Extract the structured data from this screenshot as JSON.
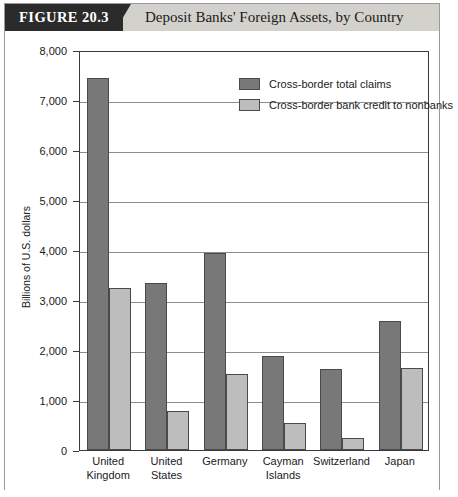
{
  "figure": {
    "tag": "FIGURE 20.3",
    "title": "Deposit Banks' Foreign Assets, by Country"
  },
  "legend": {
    "items": [
      {
        "label": "Cross-border total claims",
        "swatch": "#787878",
        "key": "legend-swatch-dark"
      },
      {
        "label": "Cross-border bank credit to nonbanks",
        "swatch": "#bdbdbd",
        "key": "legend-swatch-light"
      }
    ]
  },
  "axes": {
    "y_title": "Billions of U.S. dollars",
    "y_ticks": [
      "0",
      "1,000",
      "2,000",
      "3,000",
      "4,000",
      "5,000",
      "6,000",
      "7,000",
      "8,000"
    ]
  },
  "categories": [
    {
      "line1": "United",
      "line2": "Kingdom"
    },
    {
      "line1": "United",
      "line2": "States"
    },
    {
      "line1": "Germany",
      "line2": ""
    },
    {
      "line1": "Cayman",
      "line2": "Islands"
    },
    {
      "line1": "Switzerland",
      "line2": ""
    },
    {
      "line1": "Japan",
      "line2": ""
    }
  ],
  "chart_data": {
    "type": "bar",
    "title": "Deposit Banks' Foreign Assets, by Country",
    "xlabel": "",
    "ylabel": "Billions of U.S. dollars",
    "ylim": [
      0,
      8000
    ],
    "ytick_step": 1000,
    "grid": true,
    "legend_position": "top-right-inside",
    "categories": [
      "United Kingdom",
      "United States",
      "Germany",
      "Cayman Islands",
      "Switzerland",
      "Japan"
    ],
    "series": [
      {
        "name": "Cross-border total claims",
        "color": "#787878",
        "values": [
          7450,
          3340,
          3950,
          1890,
          1620,
          2590
        ]
      },
      {
        "name": "Cross-border bank credit to nonbanks",
        "color": "#bdbdbd",
        "values": [
          3240,
          780,
          1520,
          550,
          240,
          1650
        ]
      }
    ]
  }
}
